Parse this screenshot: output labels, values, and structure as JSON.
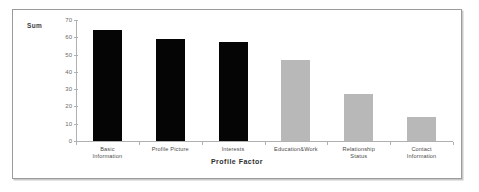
{
  "chart_data": {
    "type": "bar",
    "title": "",
    "xlabel": "Profile Factor",
    "ylabel": "Sum",
    "ylim": [
      0,
      70
    ],
    "yticks": [
      0,
      10,
      20,
      30,
      40,
      50,
      60,
      70
    ],
    "grid": false,
    "legend": "none",
    "categories": [
      "Basic Information",
      "Profile Picture",
      "Interests",
      "Education&Work",
      "Relationship Status",
      "Contact Information"
    ],
    "category_lines": [
      [
        "Basic",
        "Information"
      ],
      [
        "Profile Picture"
      ],
      [
        "Interests"
      ],
      [
        "Education&Work"
      ],
      [
        "Relationship",
        "Status"
      ],
      [
        "Contact",
        "Information"
      ]
    ],
    "values": [
      64,
      59,
      57,
      47,
      27,
      14
    ],
    "bar_colors": [
      "#050505",
      "#050505",
      "#050505",
      "#b8b8b8",
      "#b8b8b8",
      "#b8b8b8"
    ],
    "colors": {
      "dark_bar": "#050505",
      "light_bar": "#b8b8b8",
      "axis": "#b0b0b0",
      "frame": "#9b9b9b",
      "background": "#ffffff",
      "tick_text": "#6a6a6a"
    }
  }
}
